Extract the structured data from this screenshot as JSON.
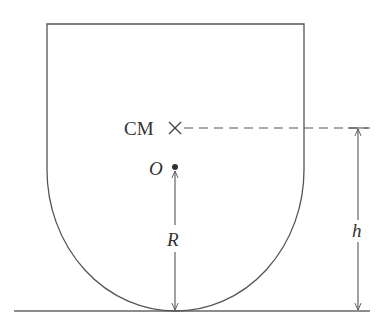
{
  "diagram": {
    "labels": {
      "center_of_mass": "CM",
      "origin": "O",
      "radius": "R",
      "height": "h"
    },
    "colors": {
      "stroke": "#555555",
      "text": "#333333"
    }
  }
}
